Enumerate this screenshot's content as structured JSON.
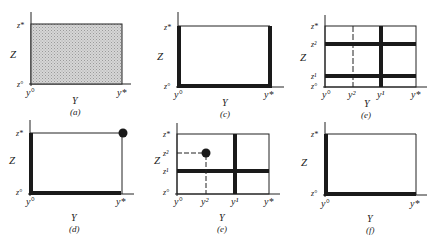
{
  "header_fragment": "",
  "colors": {
    "ink": "#1a1a1a",
    "shade": "#c8c8c8",
    "background": "#ffffff"
  },
  "panels": [
    {
      "id": "a",
      "caption": "(a)",
      "x_axis_label": "Y",
      "z_axis_label": "Z",
      "y_ticks": [
        "y°",
        "y*"
      ],
      "z_ticks": [
        "z°",
        "z*"
      ],
      "description": "shaded rectangle"
    },
    {
      "id": "b",
      "caption": "(b)",
      "x_axis_label": "Y",
      "z_axis_label": "Z",
      "y_ticks": [
        "y°",
        "y*"
      ],
      "z_ticks": [
        "z°",
        "z*"
      ],
      "description": "thick left, bottom and right edges"
    },
    {
      "id": "c",
      "caption": "(c)",
      "x_axis_label": "Y",
      "z_axis_label": "Z",
      "y_ticks": [
        "y°",
        "y²",
        "y¹",
        "y*"
      ],
      "z_ticks": [
        "z°",
        "z¹",
        "z²",
        "z*"
      ],
      "description": "thick lines at z¹, z², y¹; dashed at y²"
    },
    {
      "id": "d",
      "caption": "(d)",
      "x_axis_label": "Y",
      "z_axis_label": "Z",
      "y_ticks": [
        "y°",
        "y*"
      ],
      "z_ticks": [
        "z°",
        "z*"
      ],
      "description": "thick left and bottom edges, dot at (y*, z*)"
    },
    {
      "id": "e",
      "caption": "(e)",
      "x_axis_label": "Y",
      "z_axis_label": "Z",
      "y_ticks": [
        "y°",
        "y²",
        "y¹",
        "y*"
      ],
      "z_ticks": [
        "z°",
        "z¹",
        "z²",
        "z*"
      ],
      "description": "thick lines at z¹ and y¹; dot at (y², z²) with dashed guides"
    },
    {
      "id": "f",
      "caption": "(f)",
      "x_axis_label": "Y",
      "z_axis_label": "Z",
      "y_ticks": [
        "y°",
        "y*"
      ],
      "z_ticks": [
        "z°",
        "z*"
      ],
      "description": "thick left and bottom edges"
    }
  ]
}
